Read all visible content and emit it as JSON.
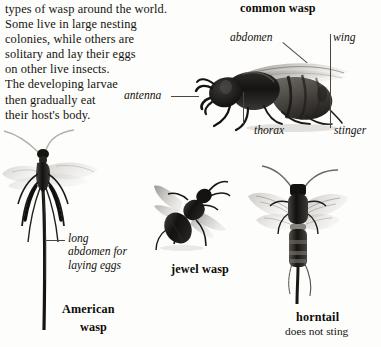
{
  "page": {
    "background_color": "#fdfdfb",
    "text_color": "#15130f"
  },
  "body_text": {
    "lines": [
      "types of wasp around the world.",
      "Some live in large nesting",
      "colonies, while others are",
      "solitary and lay their eggs",
      "on other live insects.",
      "The developing larvae",
      "then gradually eat",
      "their host's body."
    ]
  },
  "figures": {
    "common_wasp": {
      "caption": "common wasp",
      "labels": {
        "abdomen": "abdomen",
        "wing": "wing",
        "antenna": "antenna",
        "thorax": "thorax",
        "stinger": "stinger"
      }
    },
    "american_wasp": {
      "caption_line1": "American",
      "caption_line2": "wasp",
      "label_line1": "long",
      "label_line2": "abdomen for",
      "label_line3": "laying eggs"
    },
    "jewel_wasp": {
      "caption": "jewel wasp"
    },
    "horntail": {
      "caption": "horntail",
      "note": "does not sting"
    }
  }
}
